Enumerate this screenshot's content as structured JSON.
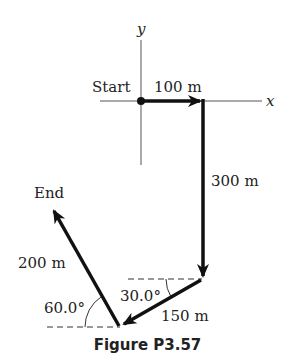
{
  "figure": {
    "caption": "Figure P3.57",
    "axes": {
      "x_label": "x",
      "y_label": "y"
    },
    "points": {
      "start_label": "Start",
      "end_label": "End"
    },
    "vectors": [
      {
        "label": "100 m",
        "direction": "east"
      },
      {
        "label": "300 m",
        "direction": "south"
      },
      {
        "label": "150 m",
        "direction": "30.0° south of west"
      },
      {
        "label": "200 m",
        "direction": "60.0° north of west"
      }
    ],
    "angles": [
      {
        "label": "30.0°"
      },
      {
        "label": "60.0°"
      }
    ]
  }
}
